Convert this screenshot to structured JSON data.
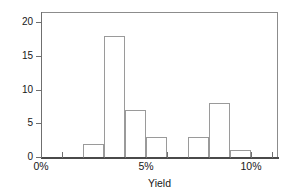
{
  "chart_data": {
    "type": "bar",
    "title": "",
    "subtitle": "",
    "xlabel": "Yield",
    "ylabel": "Frequency (number of bonds)",
    "categories": [
      "2%-3%",
      "3%-4%",
      "4%-5%",
      "5%-6%",
      "6%-7%",
      "7%-8%",
      "8%-9%",
      "9%-10%"
    ],
    "bin_starts": [
      2,
      3,
      4,
      5,
      6,
      7,
      8,
      9
    ],
    "bin_width": 1,
    "values": [
      2,
      18,
      7,
      3,
      0,
      3,
      8,
      1
    ],
    "xlim": [
      0,
      11.3
    ],
    "ylim": [
      0,
      21.5
    ],
    "xtick_labels": [
      "0%",
      "5%",
      "10%"
    ],
    "xtick_values": [
      0,
      5,
      10
    ],
    "xminor_tick_values": [
      1,
      2,
      3,
      4,
      6,
      7,
      8,
      9,
      11
    ],
    "ytick_labels": [
      "0",
      "5",
      "10",
      "15",
      "20"
    ],
    "ytick_values": [
      0,
      5,
      10,
      15,
      20
    ],
    "grid": false,
    "legend": false,
    "legend_position": "none",
    "bar_fill_color": "#ffffff",
    "bar_edge_color": "#9a9a9a",
    "axis_color": "#6f6f6f",
    "text_color": "#171717",
    "background_color": "#ffffff"
  }
}
